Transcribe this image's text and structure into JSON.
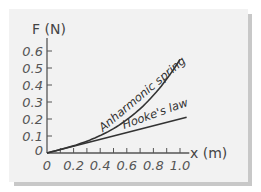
{
  "chart_data": {
    "type": "line",
    "title": "",
    "xlabel": "x (m)",
    "ylabel": "F (N)",
    "xlim": [
      0,
      1.0
    ],
    "ylim": [
      0,
      0.65
    ],
    "x_ticks": [
      "0",
      "0.2",
      "0.4",
      "0.6",
      "0.8",
      "1.0"
    ],
    "y_ticks": [
      "0",
      "0.1",
      "0.2",
      "0.3",
      "0.4",
      "0.5",
      "0.6"
    ],
    "grid": false,
    "legend": "inline labels on curves",
    "series": [
      {
        "name": "Anharmonic spring",
        "x": [
          0,
          0.1,
          0.2,
          0.3,
          0.4,
          0.5,
          0.6,
          0.7,
          0.8,
          0.9,
          1.0
        ],
        "values": [
          0,
          0.02,
          0.04,
          0.07,
          0.1,
          0.14,
          0.2,
          0.26,
          0.34,
          0.43,
          0.55
        ]
      },
      {
        "name": "Hooke's law",
        "x": [
          0,
          1.05
        ],
        "values": [
          0,
          0.21
        ]
      }
    ]
  },
  "labels": {
    "y_axis": "F (N)",
    "x_axis": "x (m)",
    "anharmonic": "Anharmonic spring",
    "hooke": "Hooke's law",
    "x_ticks": [
      "0",
      "0.2",
      "0.4",
      "0.6",
      "0.8",
      "1.0"
    ],
    "y_ticks": [
      "0",
      "0.1",
      "0.2",
      "0.3",
      "0.4",
      "0.5",
      "0.6"
    ]
  },
  "colors": {
    "panel": "#f2f2f2",
    "shadow": "#c8c8c8",
    "line": "#333333",
    "axis": "#555555"
  }
}
